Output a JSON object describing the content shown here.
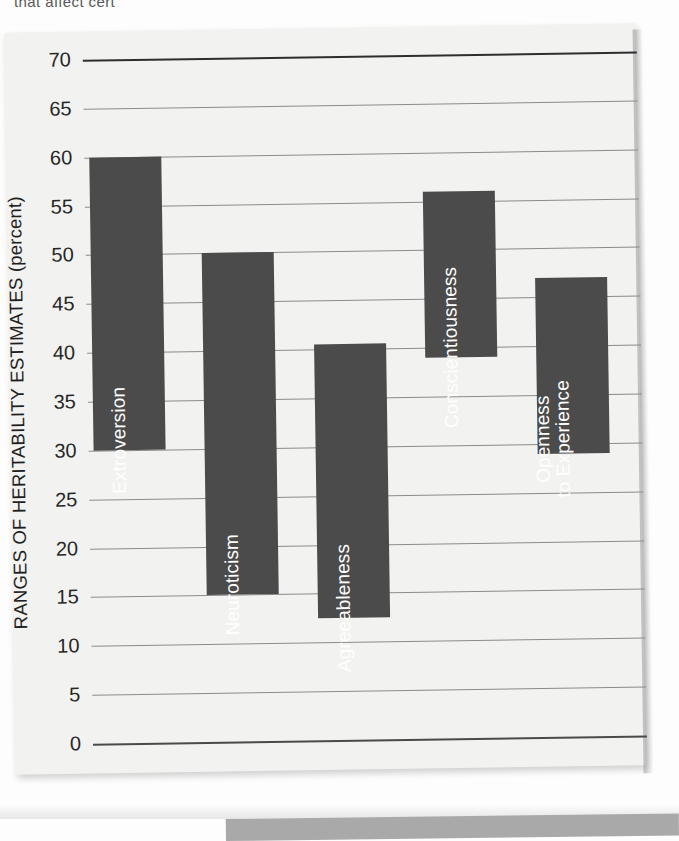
{
  "page": {
    "cutoff_text": "that affect cert"
  },
  "chart_data": {
    "type": "bar",
    "title": "",
    "subtitle": "",
    "xlabel": "",
    "ylabel": "RANGES OF HERITABILITY ESTIMATES (percent)",
    "ylim": [
      0,
      70
    ],
    "ytick_labels": [
      "0",
      "5",
      "10",
      "15",
      "20",
      "25",
      "30",
      "35",
      "40",
      "45",
      "50",
      "55",
      "60",
      "65",
      "70"
    ],
    "yticks": [
      0,
      5,
      10,
      15,
      20,
      25,
      30,
      35,
      40,
      45,
      50,
      55,
      60,
      65,
      70
    ],
    "grid": true,
    "legend": "none",
    "categories": [
      "Extroversion",
      "Neuroticism",
      "Agreeableness",
      "Conscientiousness",
      "Openness to Experience"
    ],
    "ranges": [
      {
        "label": "Extroversion",
        "low": 30,
        "high": 60,
        "label_lines": [
          "Extroversion"
        ]
      },
      {
        "label": "Neuroticism",
        "low": 15,
        "high": 50,
        "label_lines": [
          "Neuroticism"
        ]
      },
      {
        "label": "Agreeableness",
        "low": 12.5,
        "high": 40.5,
        "label_lines": [
          "Agreeableness"
        ]
      },
      {
        "label": "Conscientiousness",
        "low": 39,
        "high": 56,
        "label_lines": [
          "Conscientiousness"
        ]
      },
      {
        "label": "Openness to Experience",
        "low": 29,
        "high": 47,
        "label_lines": [
          "Openness",
          "to Experience"
        ]
      }
    ],
    "bar_color": "#4b4b4b",
    "grid_color": "#8b8b8b",
    "axis_color": "#2e2e2e",
    "background_color": "#f2f2f0"
  }
}
